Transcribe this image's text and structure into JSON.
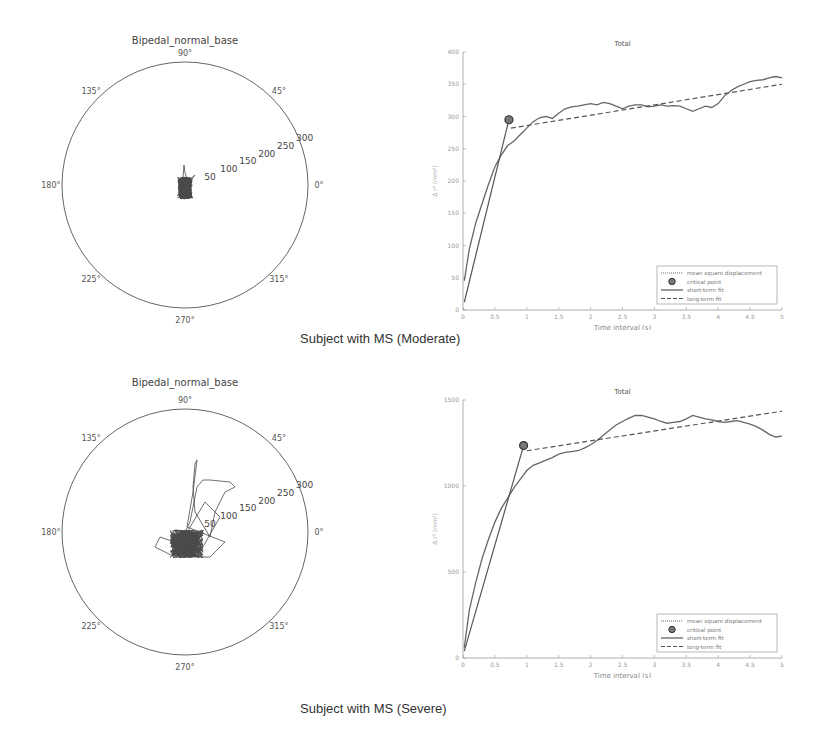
{
  "captions": {
    "moderate": "Subject with MS (Moderate)",
    "severe": "Subject with MS (Severe)"
  },
  "chart_data": [
    {
      "id": "polar-moderate",
      "type": "scatter",
      "projection": "polar",
      "title": "Bipedal_normal_base",
      "angle_ticks": [
        "0°",
        "45°",
        "90°",
        "135°",
        "180°",
        "225°",
        "270°",
        "315°"
      ],
      "radial_ticks": [
        "50",
        "100",
        "150",
        "200",
        "250",
        "300"
      ],
      "rlim": [
        0,
        300
      ],
      "description": "Center-of-pressure trajectory, compact dark cluster around origin, extent roughly 25 units, slight upward spike to ~30"
    },
    {
      "id": "msd-moderate",
      "type": "line",
      "title": "Total",
      "xlabel": "Time interval (s)",
      "ylabel": "Δ r² (mm²)",
      "xlim": [
        0,
        5
      ],
      "ylim": [
        0,
        400
      ],
      "xticks": [
        "0",
        "0.5",
        "1",
        "1.5",
        "2",
        "2.5",
        "3",
        "3.5",
        "4",
        "4.5",
        "5"
      ],
      "yticks": [
        "0",
        "50",
        "100",
        "150",
        "200",
        "250",
        "300",
        "350",
        "400"
      ],
      "legend": [
        "mean square displacement",
        "critical point",
        "short-term fit",
        "long-term fit"
      ],
      "legend_position": "lower right",
      "critical_point": {
        "x": 0.72,
        "y": 295
      },
      "series": [
        {
          "name": "mean square displacement",
          "style": "dotted",
          "x": [
            0.02,
            0.1,
            0.2,
            0.3,
            0.4,
            0.5,
            0.6,
            0.7,
            0.8,
            0.9,
            1.0,
            1.1,
            1.2,
            1.3,
            1.4,
            1.5,
            1.6,
            1.7,
            1.8,
            1.9,
            2.0,
            2.1,
            2.2,
            2.3,
            2.4,
            2.5,
            2.6,
            2.7,
            2.8,
            2.9,
            3.0,
            3.1,
            3.2,
            3.3,
            3.4,
            3.5,
            3.6,
            3.7,
            3.8,
            3.9,
            4.0,
            4.1,
            4.2,
            4.3,
            4.4,
            4.5,
            4.6,
            4.7,
            4.8,
            4.9,
            5.0
          ],
          "y": [
            45,
            95,
            135,
            165,
            195,
            222,
            240,
            255,
            262,
            272,
            282,
            292,
            298,
            300,
            297,
            305,
            312,
            315,
            316,
            318,
            320,
            318,
            322,
            320,
            316,
            312,
            316,
            318,
            318,
            315,
            316,
            318,
            316,
            317,
            316,
            312,
            308,
            312,
            316,
            314,
            320,
            332,
            340,
            346,
            350,
            354,
            356,
            357,
            360,
            362,
            360
          ]
        },
        {
          "name": "short-term fit",
          "style": "solid",
          "x": [
            0.02,
            0.72
          ],
          "y": [
            12,
            295
          ]
        },
        {
          "name": "long-term fit",
          "style": "dashed",
          "x": [
            0.75,
            5.0
          ],
          "y": [
            282,
            350
          ]
        }
      ]
    },
    {
      "id": "polar-severe",
      "type": "scatter",
      "projection": "polar",
      "title": "Bipedal_normal_base",
      "angle_ticks": [
        "0°",
        "45°",
        "90°",
        "135°",
        "180°",
        "225°",
        "270°",
        "315°"
      ],
      "radial_ticks": [
        "50",
        "100",
        "150",
        "200",
        "250",
        "300"
      ],
      "rlim": [
        0,
        300
      ],
      "description": "Center-of-pressure trajectory, dense cluster near origin (~50 units) with excursions up to ~140 toward 60-70° and a spike toward 90°"
    },
    {
      "id": "msd-severe",
      "type": "line",
      "title": "Total",
      "xlabel": "Time interval (s)",
      "ylabel": "Δ r² (mm²)",
      "xlim": [
        0,
        5
      ],
      "ylim": [
        0,
        1500
      ],
      "xticks": [
        "0",
        "0.5",
        "1",
        "1.5",
        "2",
        "2.5",
        "3",
        "3.5",
        "4",
        "4.5",
        "5"
      ],
      "yticks": [
        "0",
        "500",
        "1000",
        "1500"
      ],
      "legend": [
        "mean square displacement",
        "critical point",
        "short-term fit",
        "long-term fit"
      ],
      "legend_position": "lower right",
      "critical_point": {
        "x": 0.95,
        "y": 1235
      },
      "series": [
        {
          "name": "mean square displacement",
          "style": "dotted",
          "x": [
            0.02,
            0.1,
            0.2,
            0.3,
            0.4,
            0.5,
            0.6,
            0.7,
            0.8,
            0.9,
            1.0,
            1.1,
            1.2,
            1.3,
            1.4,
            1.5,
            1.6,
            1.7,
            1.8,
            1.9,
            2.0,
            2.1,
            2.2,
            2.3,
            2.4,
            2.5,
            2.6,
            2.7,
            2.8,
            2.9,
            3.0,
            3.1,
            3.2,
            3.3,
            3.4,
            3.5,
            3.6,
            3.7,
            3.8,
            3.9,
            4.0,
            4.1,
            4.2,
            4.3,
            4.4,
            4.5,
            4.6,
            4.7,
            4.8,
            4.9,
            5.0
          ],
          "y": [
            60,
            280,
            440,
            580,
            690,
            790,
            870,
            930,
            990,
            1040,
            1090,
            1120,
            1135,
            1150,
            1165,
            1185,
            1195,
            1200,
            1205,
            1220,
            1240,
            1265,
            1295,
            1325,
            1355,
            1375,
            1395,
            1410,
            1410,
            1400,
            1390,
            1375,
            1365,
            1370,
            1375,
            1390,
            1410,
            1400,
            1390,
            1385,
            1375,
            1370,
            1375,
            1380,
            1370,
            1360,
            1345,
            1325,
            1300,
            1285,
            1290
          ]
        },
        {
          "name": "short-term fit",
          "style": "solid",
          "x": [
            0.02,
            0.95
          ],
          "y": [
            40,
            1235
          ]
        },
        {
          "name": "long-term fit",
          "style": "dashed",
          "x": [
            1.0,
            5.0
          ],
          "y": [
            1205,
            1435
          ]
        }
      ]
    }
  ]
}
